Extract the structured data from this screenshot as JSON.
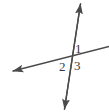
{
  "figure": {
    "kind": "geometry-diagram",
    "width": 109,
    "height": 112,
    "background_color": "#ffffff",
    "stroke_color": "#4a4a4a",
    "label_color": "#3a3a3a",
    "stroke_width": 1.4
  },
  "lines": [
    {
      "name": "steep-line",
      "label": "near-vertical transversal",
      "x1": 80.5,
      "y1": 4,
      "x2": 64.5,
      "y2": 109,
      "arrow_start": true,
      "arrow_end": true
    },
    {
      "name": "shallow-line",
      "label": "rising line from lower-left to right edge",
      "x1": 13,
      "y1": 71,
      "x2": 109,
      "y2": 46.5,
      "arrow_start": true,
      "arrow_end": false
    }
  ],
  "intersection": {
    "name": "intersection-point",
    "x": 70,
    "y": 58
  },
  "labels": {
    "angle_1": "1",
    "angle_2": "2",
    "angle_3": "3"
  },
  "angle_positions": {
    "angle_1": {
      "x": 78,
      "y": 49,
      "region": "upper-right"
    },
    "angle_2": {
      "x": 63,
      "y": 67,
      "region": "lower-left"
    },
    "angle_3": {
      "x": 78,
      "y": 66,
      "region": "lower-right"
    }
  }
}
